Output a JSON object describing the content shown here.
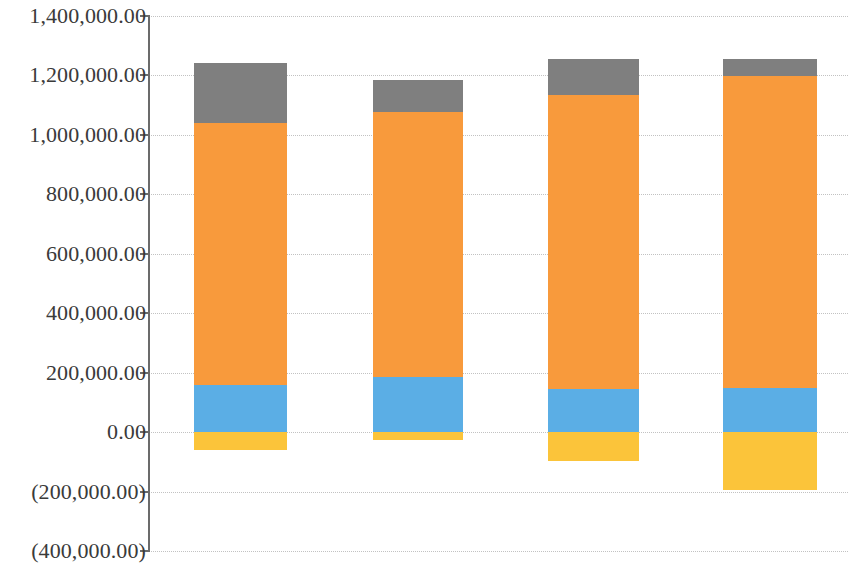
{
  "chart_data": {
    "type": "bar",
    "stacked": true,
    "title": "",
    "subtitle": "",
    "xlabel": "",
    "ylabel": "",
    "categories": [
      "1",
      "2",
      "3",
      "4"
    ],
    "category_labels_visible": false,
    "grid": true,
    "legend_visible": false,
    "ylim": [
      -400000,
      1400000
    ],
    "y_tick_step": 200000,
    "y_tick_values": [
      1400000,
      1200000,
      1000000,
      800000,
      600000,
      400000,
      200000,
      0,
      -200000,
      -400000
    ],
    "y_tick_labels": [
      "1,400,000.00",
      "1,200,000.00",
      "1,000,000.00",
      "800,000.00",
      "600,000.00",
      "400,000.00",
      "200,000.00",
      "0.00",
      "(200,000.00)",
      "(400,000.00)"
    ],
    "series": [
      {
        "name": "series-1-yellow",
        "color": "#FBC43A",
        "values": [
          -61000,
          -27000,
          -98000,
          -196000
        ]
      },
      {
        "name": "series-2-blue",
        "color": "#5BAEE5",
        "values": [
          158000,
          187000,
          144000,
          147000
        ]
      },
      {
        "name": "series-3-orange",
        "color": "#F89A3C",
        "values": [
          881000,
          890000,
          990000,
          1050000
        ]
      },
      {
        "name": "series-4-gray",
        "color": "#7F7F7F",
        "values": [
          202000,
          108000,
          120000,
          60000
        ]
      }
    ],
    "bar_totals_positive": [
      1240000,
      1158000,
      1250000,
      1250000
    ],
    "bar_totals_negative": [
      -61000,
      -27000,
      -98000,
      -196000
    ],
    "axis_line_color": "#6B6B6B",
    "gridline_color": "#C2C2C2",
    "background_color": "#FFFFFF",
    "tick_label_color": "#3A3A3A"
  },
  "layout": {
    "plot_left_px": 148,
    "plot_right_px": 848,
    "y_top_px": 16,
    "y_bottom_px": 551,
    "zero_px": 432.8,
    "bars": [
      {
        "left": 46,
        "width": 93
      },
      {
        "left": 225,
        "width": 90
      },
      {
        "left": 400,
        "width": 91
      },
      {
        "left": 575,
        "width": 94
      }
    ]
  }
}
